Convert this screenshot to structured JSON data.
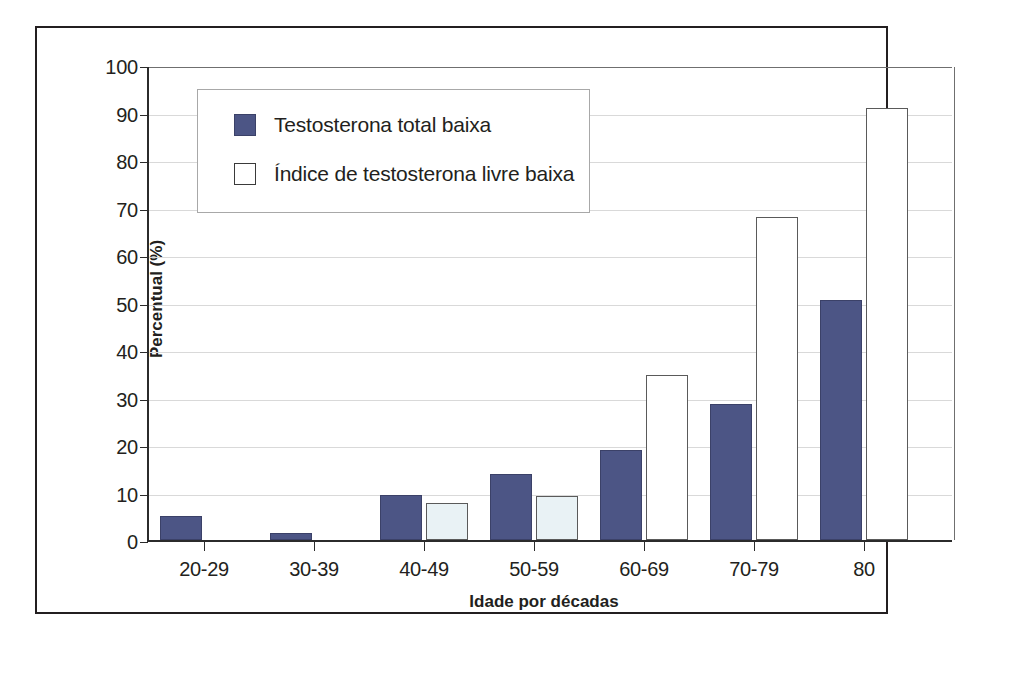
{
  "chart_data": {
    "type": "bar",
    "title": "",
    "xlabel": "Idade por décadas",
    "ylabel": "Percentual (%)",
    "categories": [
      "20-29",
      "30-39",
      "40-49",
      "50-59",
      "60-69",
      "70-79",
      "80"
    ],
    "series": [
      {
        "name": "Testosterona total baixa",
        "color": "#4c5585",
        "values": [
          5.0,
          1.5,
          9.5,
          14.0,
          19.0,
          28.7,
          50.5
        ]
      },
      {
        "name": "Índice de testosterona livre baixa",
        "color": "#ffffff",
        "values": [
          0,
          0,
          7.7,
          9.3,
          34.8,
          68.0,
          91.0
        ]
      }
    ],
    "ylim": [
      0,
      100
    ],
    "yticks": [
      0,
      10,
      20,
      30,
      40,
      50,
      60,
      70,
      80,
      90,
      100
    ],
    "ytick_labels": [
      "0",
      "10",
      "20",
      "30",
      "40",
      "50",
      "60",
      "70",
      "80",
      "90",
      "100"
    ],
    "grid": true,
    "legend_position": "upper left"
  },
  "legend": {
    "entries": [
      {
        "label": "Testosterona total baixa",
        "swatch": "filled-navy"
      },
      {
        "label": "Índice de testosterona livre baixa",
        "swatch": "outlined-white"
      }
    ]
  },
  "axes": {
    "y_label": "Percentual (%)",
    "x_label": "Idade por décadas",
    "y_ticks": [
      "0",
      "10",
      "20",
      "30",
      "40",
      "50",
      "60",
      "70",
      "80",
      "90",
      "100"
    ],
    "x_ticks": [
      "20-29",
      "30-39",
      "40-49",
      "50-59",
      "60-69",
      "70-79",
      "80"
    ]
  }
}
